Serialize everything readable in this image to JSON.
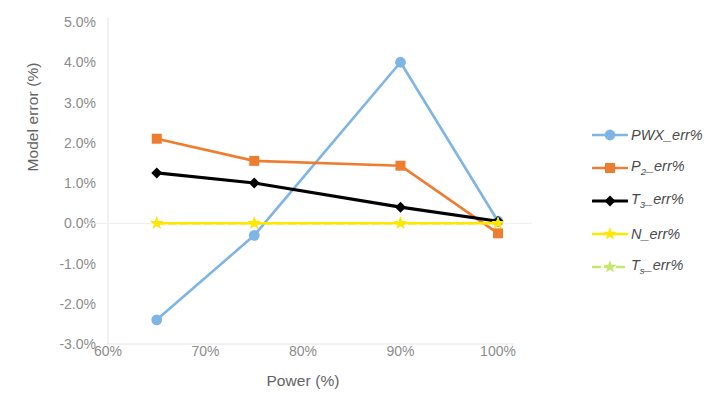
{
  "chart_data": {
    "type": "line",
    "title": "",
    "xlabel": "Power (%)",
    "ylabel": "Model error (%)",
    "x": [
      65,
      75,
      90,
      100
    ],
    "xlim": [
      60,
      100
    ],
    "ylim": [
      -3.0,
      5.0
    ],
    "grid": false,
    "legend_position": "right",
    "x_tick_labels": [
      "60%",
      "70%",
      "80%",
      "90%",
      "100%"
    ],
    "x_tick_values": [
      60,
      70,
      80,
      90,
      100
    ],
    "y_tick_labels": [
      "5.0%",
      "4.0%",
      "3.0%",
      "2.0%",
      "1.0%",
      "0.0%",
      "-1.0%",
      "-2.0%",
      "-3.0%"
    ],
    "y_tick_values": [
      5.0,
      4.0,
      3.0,
      2.0,
      1.0,
      0.0,
      -1.0,
      -2.0,
      -3.0
    ],
    "series": [
      {
        "name": "PWX_err%",
        "label_base": "PWX",
        "label_sub": "",
        "label_suffix": "_err%",
        "color": "#7FB5E4",
        "marker": "circle",
        "line_style": "solid",
        "values": [
          -2.4,
          -0.3,
          4.0,
          0.05
        ]
      },
      {
        "name": "P2_err%",
        "label_base": "P",
        "label_sub": "2",
        "label_suffix": "_err%",
        "color": "#ED7D31",
        "marker": "square",
        "line_style": "solid",
        "values": [
          2.1,
          1.55,
          1.43,
          -0.25
        ]
      },
      {
        "name": "T3_err%",
        "label_base": "T",
        "label_sub": "3",
        "label_suffix": "_err%",
        "color": "#000000",
        "marker": "diamond",
        "line_style": "solid",
        "values": [
          1.25,
          1.0,
          0.4,
          0.05
        ]
      },
      {
        "name": "N_err%",
        "label_base": "N",
        "label_sub": "",
        "label_suffix": "_err%",
        "color": "#FFE700",
        "marker": "star",
        "line_style": "solid",
        "values": [
          0.0,
          0.0,
          0.0,
          0.0
        ]
      },
      {
        "name": "Ts_err%",
        "label_base": "T",
        "label_sub": "s",
        "label_suffix": "_err%",
        "color": "#C5E86C",
        "marker": "star",
        "line_style": "dashed",
        "values": [
          0.0,
          0.0,
          0.0,
          0.0
        ]
      }
    ]
  },
  "axes": {
    "y_title": "Model error (%)",
    "x_title": "Power (%)"
  },
  "legend": {
    "items": [
      {
        "label": "PWX_err%"
      },
      {
        "label": "P2_err%"
      },
      {
        "label": "T3_err%"
      },
      {
        "label": "N_err%"
      },
      {
        "label": "Ts_err%"
      }
    ]
  }
}
